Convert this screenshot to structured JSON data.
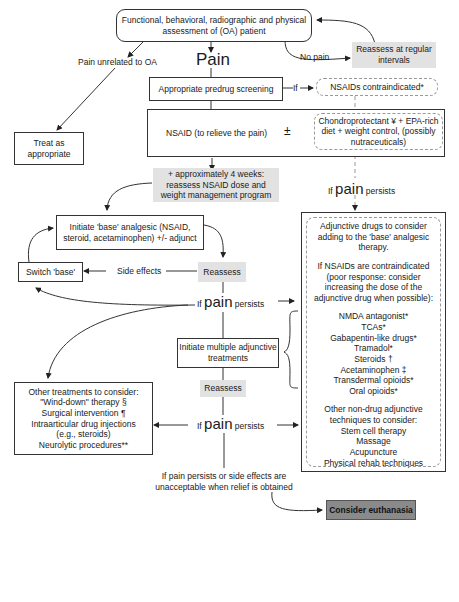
{
  "nodes": {
    "assessment": "Functional, behavioral, radiographic and physical assessment of (OA) patient",
    "pain_label": "Pain",
    "pain_unrelated": "Pain unrelated to OA",
    "no_pain": "No pain",
    "reassess_regular": "Reassess at regular intervals",
    "treat_as_appropriate": "Treat as appropriate",
    "predrug_screening": "Appropriate predrug screening",
    "if_label": "If",
    "nsaids_contraindicated": "NSAIDs contraindicated*",
    "nsaid_relieve": "NSAID (to relieve the pain)",
    "plus_minus": "±",
    "chondroprotectant": "Chondroprotectant ¥ + EPA-rich diet + weight control, (possibly nutraceuticals)",
    "four_weeks": "+ approximately 4 weeks: reassess NSAID dose and weight management program",
    "if_pain_persists": {
      "if": "If",
      "pain": "pain",
      "persists": "persists"
    },
    "initiate_base": "Initiate 'base' analgesic (NSAID, steroid, acetaminophen) +/- adjunct",
    "switch_base": "Switch 'base'",
    "side_effects": "Side effects",
    "reassess": "Reassess",
    "initiate_multiple": "Initiate multiple adjunctive treatments",
    "reassess_2": "Reassess",
    "final_condition": "If pain persists or side effects are unacceptable when relief is obtained",
    "euthanasia": "Consider euthanasia"
  },
  "other_treatments": {
    "heading": "Other treatments to consider:",
    "items": [
      "\"Wind-down\" therapy §",
      "Surgical intervention ¶",
      "Intraarticular drug injections",
      "(e.g., steroids)",
      "Neurolytic procedures**"
    ]
  },
  "adjunctive": {
    "intro": "Adjunctive drugs to consider adding to the 'base' analgesic therapy.",
    "contra": "If NSAIDs are contraindicated (poor response: consider increasing the dose of the adjunctive drug when possible):",
    "drugs": [
      "NMDA antagonist*",
      "TCAs*",
      "Gabapentin-like drugs*",
      "Tramadol*",
      "Steroids †",
      "Acetaminophen ‡",
      "Transdermal opioids*",
      "Oral opioids*"
    ],
    "nondrug_heading": "Other non-drug adjunctive techniques to consider:",
    "nondrug": [
      "Stem cell therapy",
      "Massage",
      "Acupuncture",
      "Physical rehab techniques"
    ]
  },
  "colors": {
    "shade": "#e2e2e2",
    "dark": "#8a8a8a",
    "line": "#333333",
    "dash": "#999999"
  }
}
